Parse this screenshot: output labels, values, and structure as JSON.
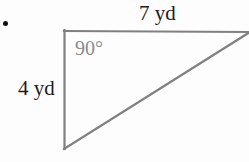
{
  "figure": {
    "kind": "right-triangle-diagram",
    "bullet": "•",
    "labels": {
      "top_side": "7 yd",
      "left_side": "4 yd",
      "interior_angle": "90°"
    },
    "colors": {
      "stroke": "#808080",
      "angle_text": "#8c8c8c",
      "label_text": "#1b1b1b",
      "background": "#fdfdfd",
      "bullet": "#111111"
    },
    "geometry": {
      "vertex_top_left": [
        64,
        31
      ],
      "vertex_top_right": [
        249,
        32
      ],
      "vertex_bottom_left": [
        64,
        149
      ],
      "stroke_width": 2,
      "sides": [
        {
          "name": "top",
          "from": [
            64,
            31
          ],
          "to": [
            249,
            32
          ],
          "measure": "7 yd"
        },
        {
          "name": "left",
          "from": [
            64,
            31
          ],
          "to": [
            64,
            149
          ],
          "measure": "4 yd"
        },
        {
          "name": "hypotenuse",
          "from": [
            64,
            149
          ],
          "to": [
            249,
            32
          ],
          "measure": ""
        }
      ]
    }
  }
}
